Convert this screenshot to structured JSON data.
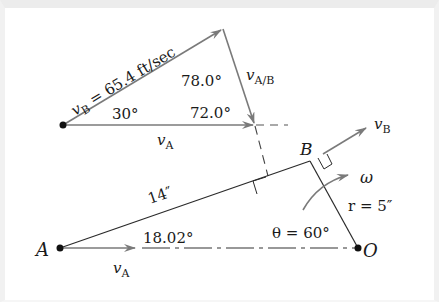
{
  "diagram": {
    "type": "velocity-vector-diagram",
    "colors": {
      "vector": "#7a7a7a",
      "line": "#2a2a2a",
      "text": "#1a1a1a",
      "border": "#ececec"
    },
    "vector_triangle": {
      "vB_label_symbol": "v",
      "vB_label_sub": "B",
      "vB_value": " = 65.4 ft/sec",
      "vA_symbol": "v",
      "vA_sub": "A",
      "vAB_symbol": "v",
      "vAB_sub": "A/B",
      "angle_30": "30°",
      "angle_78": "78.0°",
      "angle_72": "72.0°"
    },
    "linkage": {
      "point_A": "A",
      "point_B": "B",
      "point_O": "O",
      "rod_length": "14″",
      "angle_rod": "18.02°",
      "theta_label": "θ = 60°",
      "radius_label": "r = 5″",
      "omega": "ω",
      "vA_symbol": "v",
      "vA_sub": "A",
      "vB_symbol": "v",
      "vB_sub": "B"
    }
  }
}
